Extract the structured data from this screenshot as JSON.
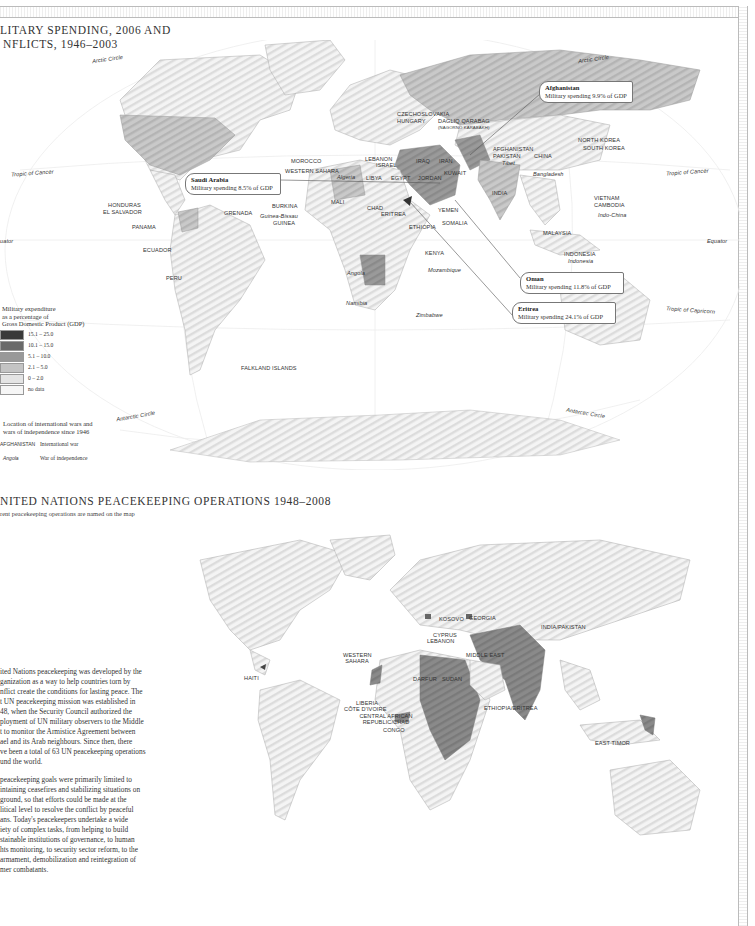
{
  "page": {
    "header_bar": "decorative hatched bar",
    "right_bar": "decorative hatched bar"
  },
  "map1": {
    "title_line1": "LITARY SPENDING, 2006 AND",
    "title_line2": "NFLICTS, 1946–2003",
    "latitude_lines": {
      "arctic_left": "Arctic Circle",
      "arctic_right": "Arctic Circle",
      "tropic_cancer_left": "Tropic of Cancer",
      "tropic_cancer_right": "Tropic of Cancer",
      "equator_left": "uator",
      "equator_right": "Equator",
      "tropic_capricorn_right": "Tropic of Capricorn",
      "antarctic_left": "Antarctic Circle",
      "antarctic_right": "Antarctic Circle"
    },
    "international_wars": [
      "CZECHOSLOVAKIA",
      "HUNGARY",
      "DAGLIQ QARABAG",
      "(NAGORNO KARABAKH)",
      "AFGHANISTAN",
      "PAKISTAN",
      "CHINA",
      "NORTH KOREA",
      "SOUTH KOREA",
      "MOROCCO",
      "WESTERN SAHARA",
      "LEBANON",
      "ISRAEL",
      "IRAQ",
      "IRAN",
      "KUWAIT",
      "LIBYA",
      "EGYPT",
      "JORDAN",
      "INDIA",
      "HONDURAS",
      "EL SALVADOR",
      "GRENADA",
      "PANAMA",
      "BURKINA",
      "GUINEA",
      "MALI",
      "CHAD",
      "ERITREA",
      "YEMEN",
      "ETHIOPIA",
      "SOMALIA",
      "VIETNAM",
      "CAMBODIA",
      "ECUADOR",
      "PERU",
      "KENYA",
      "MALAYSIA",
      "INDONESIA",
      "FALKLAND ISLANDS"
    ],
    "wars_of_independence": [
      "Algeria",
      "Tibet",
      "Bangladesh",
      "Guinea-Bissau",
      "Indo-China",
      "Angola",
      "Mozambique",
      "Namibia",
      "Zimbabwe",
      "Indonesia"
    ],
    "callouts": [
      {
        "country": "Afghanistan",
        "text": "Military spending 9.9% of GDP"
      },
      {
        "country": "Saudi Arabia",
        "text": "Military spending 8.5% of GDP"
      },
      {
        "country": "Oman",
        "text": "Military spending 11.8% of GDP"
      },
      {
        "country": "Eritrea",
        "text": "Military spending 24.1% of GDP"
      }
    ],
    "legend": {
      "heading_line1": "Military expenditure",
      "heading_line2": "as a percentage of",
      "heading_line3": "Gross Domestic Product (GDP)",
      "items": [
        {
          "label": "15.1 – 25.0",
          "color": "#3a3a3a"
        },
        {
          "label": "10.1 – 15.0",
          "color": "#6a6a6a"
        },
        {
          "label": "5.1 – 10.0",
          "color": "#999999"
        },
        {
          "label": "2.1 – 5.0",
          "color": "#c4c4c4"
        },
        {
          "label": "0 – 2.0",
          "color": "#e4e4e4"
        },
        {
          "label": "no data",
          "color": "#f6f6f6"
        }
      ],
      "wars_heading_line1": "Location of international wars and",
      "wars_heading_line2": "wars of independence since 1946",
      "wars_rows": [
        {
          "sample": "AFGHANISTAN",
          "meaning": "International war"
        },
        {
          "sample": "Angola",
          "meaning": "War of independence"
        }
      ]
    }
  },
  "map2": {
    "title": "NITED NATIONS PEACEKEEPING OPERATIONS 1948–2008",
    "subtitle": "rent peacekeeping operations are named on the map",
    "operations": [
      "KOSOVO",
      "GEORGIA",
      "CYPRUS",
      "LEBANON",
      "INDIA/PAKISTAN",
      "WESTERN SAHARA",
      "MIDDLE EAST",
      "HAITI",
      "DARFUR",
      "SUDAN",
      "LIBERIA",
      "CÔTE D'IVOIRE",
      "CENTRAL AFRICAN REPUBLIC/CHAD",
      "CONGO",
      "ETHIOPIA/ERITREA",
      "EAST TIMOR"
    ]
  },
  "body_text": {
    "p1": [
      "ited Nations peacekeeping was developed by the",
      "ganization as a way to help countries torn by",
      "nflict create the conditions for lasting peace. The",
      "t UN peacekeeping mission was established in",
      "48, when the Security Council authorized the",
      "ployment of UN military observers to the Middle",
      "t to monitor the Armistice Agreement between",
      "ael and its Arab neighbours. Since then, there",
      "ve been a total of 63 UN peacekeeping operations",
      "und the world."
    ],
    "p2": [
      "peacekeeping goals were primarily limited to",
      "intaining ceasefires and stabilizing situations on",
      "ground, so that efforts could be made at the",
      "litical level to resolve the conflict by peaceful",
      "ans.  Today's peacekeepers undertake a wide",
      "iety of complex tasks, from helping to build",
      "stainable institutions of governance, to human",
      "hts monitoring, to security sector reform, to the",
      "armament, demobilization and reintegration of",
      "mer combatants."
    ]
  }
}
